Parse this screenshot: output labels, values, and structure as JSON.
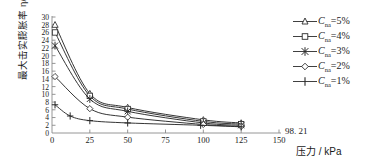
{
  "chart_data": {
    "type": "line",
    "title": "",
    "xlabel": "压力 / kPa",
    "ylabel": "最大击实膨胀率 η/%",
    "xlim": [
      0,
      150
    ],
    "ylim": [
      0,
      30
    ],
    "xticks": [
      0,
      25,
      50,
      75,
      100,
      125,
      150
    ],
    "xticklabels": [
      "0",
      "25",
      "50",
      "75",
      "100",
      "125",
      "150"
    ],
    "yticks": [
      0,
      2,
      4,
      6,
      8,
      10,
      12,
      14,
      16,
      18,
      20,
      22,
      24,
      26,
      28,
      30
    ],
    "yticklabels": [
      "0",
      "2",
      "4",
      "6",
      "8",
      "10",
      "12",
      "14",
      "16",
      "18",
      "20",
      "22",
      "24",
      "26",
      "28",
      "30"
    ],
    "grid": false,
    "legend_position": "right",
    "annotations": [
      {
        "text": "98. 21",
        "x": 98.21,
        "y": 2.0
      }
    ],
    "series": [
      {
        "name": "Cna=5%",
        "marker": "triangle",
        "x": [
          2,
          25,
          50,
          100,
          125
        ],
        "y": [
          28.0,
          10.2,
          6.6,
          3.4,
          2.6
        ]
      },
      {
        "name": "Cna=4%",
        "marker": "square",
        "x": [
          2,
          25,
          50,
          100,
          125
        ],
        "y": [
          26.0,
          9.6,
          6.2,
          3.0,
          2.3
        ]
      },
      {
        "name": "Cna=3%",
        "marker": "star",
        "x": [
          2,
          25,
          50,
          100,
          125
        ],
        "y": [
          22.6,
          8.8,
          5.6,
          2.6,
          2.0
        ]
      },
      {
        "name": "Cna=2%",
        "marker": "diamond",
        "x": [
          2,
          25,
          50,
          100,
          125
        ],
        "y": [
          14.6,
          6.3,
          4.1,
          2.2,
          1.7
        ]
      },
      {
        "name": "Cna=1%",
        "marker": "plus",
        "x": [
          2,
          12,
          25,
          50,
          98.21,
          125
        ],
        "y": [
          7.3,
          4.4,
          3.2,
          2.6,
          2.0,
          1.6
        ]
      }
    ]
  },
  "legend": {
    "items": [
      {
        "symbol": "triangle",
        "var": "C",
        "sub": "na",
        "eq": "=",
        "value": "5%"
      },
      {
        "symbol": "square",
        "var": "C",
        "sub": "na",
        "eq": "=",
        "value": "4%"
      },
      {
        "symbol": "star",
        "var": "C",
        "sub": "na",
        "eq": "=",
        "value": "3%"
      },
      {
        "symbol": "diamond",
        "var": "C",
        "sub": "na",
        "eq": "=",
        "value": "2%"
      },
      {
        "symbol": "plus",
        "var": "C",
        "sub": "na",
        "eq": "=",
        "value": "1%"
      }
    ]
  },
  "colors": {
    "line": "#2a2a2a",
    "axis": "#8a8a8a",
    "text": "#1a1a1a",
    "background": "#ffffff"
  }
}
